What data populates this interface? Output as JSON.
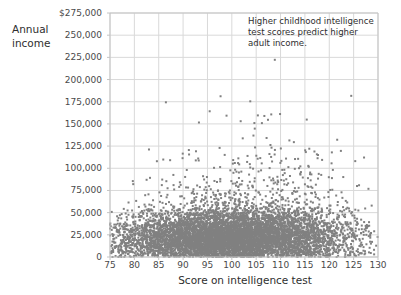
{
  "chart_data": {
    "type": "scatter",
    "title": "",
    "annotation": "Higher childhood intelligence test scores predict higher adult income.",
    "xlabel": "Score on intelligence test",
    "ylabel": "Annual\nincome",
    "ylabel_line1": "Annual",
    "ylabel_line2": "income",
    "xlim": [
      75,
      130
    ],
    "ylim": [
      0,
      275000
    ],
    "xticks": [
      75,
      80,
      85,
      90,
      95,
      100,
      105,
      110,
      115,
      120,
      125,
      130
    ],
    "xticklabels": [
      "75",
      "80",
      "85",
      "90",
      "95",
      "100",
      "105",
      "110",
      "115",
      "120",
      "125",
      "130"
    ],
    "yticks": [
      0,
      25000,
      50000,
      75000,
      100000,
      125000,
      150000,
      175000,
      200000,
      225000,
      250000,
      275000
    ],
    "yticklabels": [
      "0",
      "25,000",
      "50,000",
      "75,000",
      "100,000",
      "125,000",
      "150,000",
      "175,000",
      "200,000",
      "225,000",
      "250,000",
      "275,000"
    ],
    "grid": true,
    "legend": false,
    "marker_color": "#808080",
    "marker_size": 2,
    "grid_color": "#d9d9d9",
    "axis_color": "#c4c4c4",
    "background": "#ffffff",
    "n_points": 2600,
    "series": [
      {
        "name": "individuals",
        "points_summary": {
          "x_range": [
            75,
            130
          ],
          "y_range": [
            0,
            230000
          ],
          "bulk_y_max": 75000,
          "sparse_y_min": 100000,
          "trend": "positive"
        }
      }
    ]
  },
  "axes": {
    "y_prefix_label": "$275,000"
  }
}
